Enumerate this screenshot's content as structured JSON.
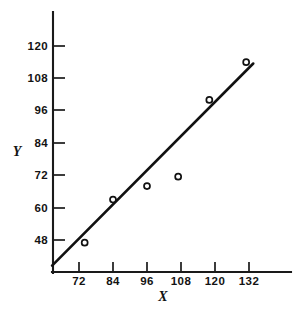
{
  "chart_data": {
    "type": "scatter",
    "title": "",
    "subtitle": "",
    "xlabel": "X",
    "ylabel": "Y",
    "xlim": [
      60,
      144
    ],
    "ylim": [
      36,
      126
    ],
    "grid": false,
    "legend": null,
    "x_ticks": [
      72,
      84,
      96,
      108,
      120,
      132
    ],
    "x_tick_labels": [
      "72",
      "84",
      "96",
      "108",
      "120",
      "132"
    ],
    "y_ticks": [
      48,
      60,
      72,
      84,
      96,
      108,
      120
    ],
    "y_tick_labels": [
      "48",
      "60",
      "72",
      "84",
      "96",
      "108",
      "120"
    ],
    "points": [
      {
        "x": 74,
        "y": 47
      },
      {
        "x": 84,
        "y": 63
      },
      {
        "x": 96,
        "y": 68
      },
      {
        "x": 107,
        "y": 71.5
      },
      {
        "x": 118,
        "y": 100
      },
      {
        "x": 131,
        "y": 114
      }
    ],
    "fit_line": {
      "name": "regression line",
      "x_start": 62.5,
      "y_start": 38.5,
      "x_end": 133.5,
      "y_end": 113.5
    },
    "axis_origin_label": ""
  },
  "figure": {
    "background_color": "#ffffff",
    "ink_color": "#131313",
    "marker_style": "open-circle",
    "marker_radius_px": 3
  }
}
